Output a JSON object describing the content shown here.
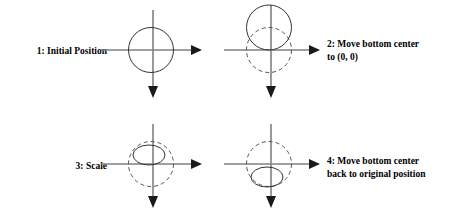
{
  "diagram": {
    "background_color": "#ffffff",
    "axis_color": "#808080",
    "shape_color": "#333333",
    "dash_color": "#555555",
    "text_color": "#000000"
  },
  "steps": [
    {
      "id": "step-1",
      "label": "1: Initial Position",
      "label_position": "left",
      "solid_shape": "circle",
      "solid_shape_position": "centered-on-origin",
      "dashed_shape": "none"
    },
    {
      "id": "step-2",
      "label": "2: Move bottom center\nto (0, 0)",
      "label_position": "right",
      "solid_shape": "circle",
      "solid_shape_position": "bottom-at-origin",
      "dashed_shape": "circle",
      "dashed_shape_position": "centered-on-origin"
    },
    {
      "id": "step-3",
      "label": "3: Scale",
      "label_position": "left",
      "solid_shape": "ellipse",
      "solid_shape_position": "bottom-at-origin",
      "dashed_shape": "circle",
      "dashed_shape_position": "centered-on-origin"
    },
    {
      "id": "step-4",
      "label": "4: Move bottom center\nback to original position",
      "label_position": "right",
      "solid_shape": "ellipse",
      "solid_shape_position": "below-origin",
      "dashed_shape": "circle",
      "dashed_shape_position": "centered-on-origin"
    }
  ],
  "axes": {
    "x_axis_direction": "right",
    "y_axis_direction": "down",
    "x_arrowhead": "filled-triangle",
    "y_arrowhead": "filled-triangle"
  }
}
